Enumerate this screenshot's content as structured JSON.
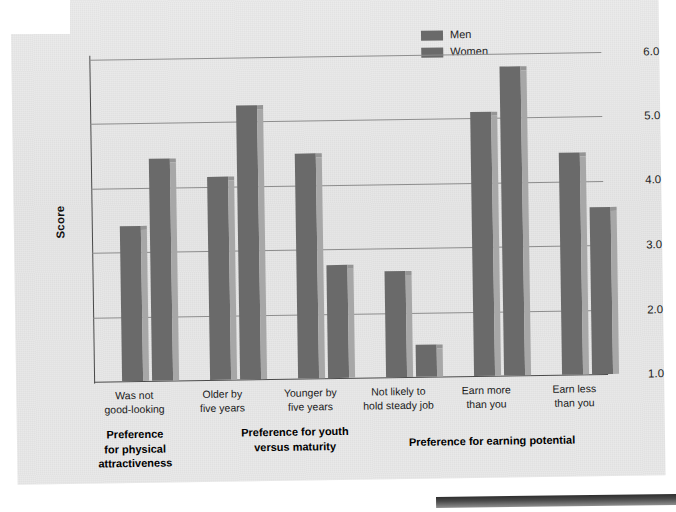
{
  "chart_data": {
    "type": "bar",
    "title": "",
    "xlabel": "",
    "ylabel": "Score",
    "ylim": [
      1.0,
      6.0
    ],
    "yticks": [
      "1.0",
      "2.0",
      "3.0",
      "4.0",
      "5.0",
      "6.0"
    ],
    "grid": true,
    "legend_position": "top-center-right",
    "categories": [
      "Was not good-looking",
      "Older by five years",
      "Younger by five years",
      "Not likely to hold steady job",
      "Earn more than you",
      "Earn less than you"
    ],
    "series": [
      {
        "name": "Men",
        "values": [
          3.4,
          4.15,
          4.5,
          2.65,
          5.1,
          4.45
        ]
      },
      {
        "name": "Women",
        "values": [
          4.45,
          5.25,
          2.75,
          1.5,
          5.8,
          3.6
        ]
      }
    ],
    "groups": [
      {
        "label": "Preference for physical attractiveness",
        "categories": [
          "Was not good-looking"
        ]
      },
      {
        "label": "Preference for youth versus maturity",
        "categories": [
          "Older by five years",
          "Younger by five years"
        ]
      },
      {
        "label": "Preference for earning potential",
        "categories": [
          "Not likely to hold steady job",
          "Earn more than you",
          "Earn less than you"
        ]
      }
    ]
  },
  "axis": {
    "y_label": "Score",
    "y_ticks": [
      "6.0",
      "5.0",
      "4.0",
      "3.0",
      "2.0",
      "1.0"
    ]
  },
  "legend": {
    "items": [
      {
        "label": "Men",
        "color": "#6a6a6a"
      },
      {
        "label": "Women",
        "color": "#6a6a6a"
      }
    ]
  },
  "x_categories": [
    {
      "line1": "Was not",
      "line2": "good-looking"
    },
    {
      "line1": "Older by",
      "line2": "five years"
    },
    {
      "line1": "Younger by",
      "line2": "five years"
    },
    {
      "line1": "Not likely to",
      "line2": "hold steady job"
    },
    {
      "line1": "Earn more",
      "line2": "than you"
    },
    {
      "line1": "Earn less",
      "line2": "than you"
    }
  ],
  "x_groups": [
    {
      "line1": "Preference",
      "line2": "for physical",
      "line3": "attractiveness"
    },
    {
      "line1": "Preference for youth",
      "line2": "versus maturity",
      "line3": ""
    },
    {
      "line1": "Preference for earning potential",
      "line2": "",
      "line3": ""
    }
  ],
  "colors": {
    "bar": "#6a6a6a",
    "bar_shade": "#a7a7a7",
    "page": "#e7e7e7",
    "gridline": "#8d8d8d",
    "axis": "#4a4a4a"
  }
}
